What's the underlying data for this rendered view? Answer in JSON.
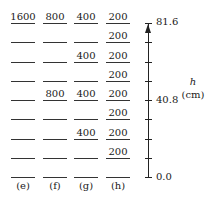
{
  "columns": [
    {
      "label": "(e)",
      "x": 11,
      "values": {
        "8": "1600"
      }
    },
    {
      "label": "(f)",
      "x": 43,
      "values": {
        "8": "800",
        "4": "800"
      }
    },
    {
      "label": "(g)",
      "x": 74,
      "values": {
        "8": "400",
        "6": "400",
        "4": "400",
        "2": "400"
      }
    },
    {
      "label": "(h)",
      "x": 106,
      "values": {
        "8": "200",
        "7": "200",
        "6": "200",
        "5": "200",
        "4": "200",
        "3": "200",
        "2": "200",
        "1": "200"
      }
    }
  ],
  "levels": 9,
  "axis": {
    "top_label": "81.6",
    "mid_label": "40.8",
    "bottom_label": "0.0",
    "variable": "h",
    "unit": "(cm)"
  }
}
